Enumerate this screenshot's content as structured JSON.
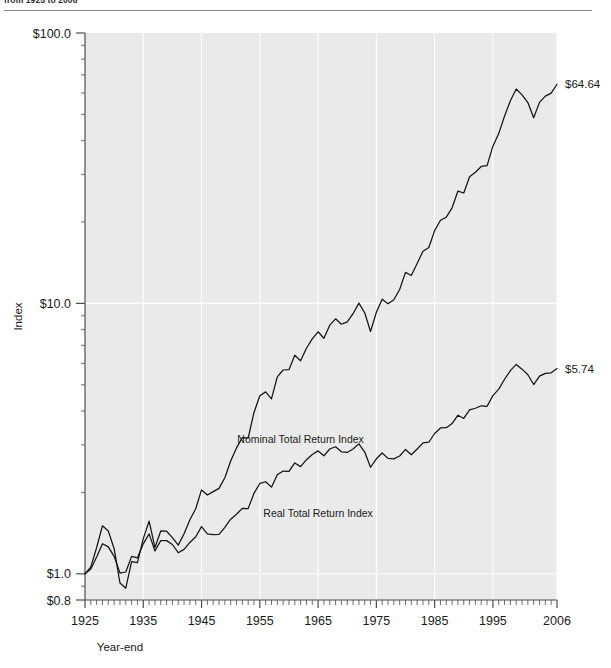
{
  "figure": {
    "title": "from 1925 to 2006",
    "title_visible": "partially cropped at top edge"
  },
  "chart_data": {
    "type": "line",
    "title": "from 1925 to 2006",
    "xlabel": "Year-end",
    "ylabel": "Index",
    "yscale": "log",
    "ylim": [
      0.8,
      100.0
    ],
    "xlim": [
      1925,
      2006
    ],
    "grid": "vertical white gridlines at each decade",
    "legend": "inline labels on plot",
    "y_ticks": [
      {
        "value": 100.0,
        "label": "$100.0"
      },
      {
        "value": 10.0,
        "label": "$10.0"
      },
      {
        "value": 1.0,
        "label": "$1.0"
      },
      {
        "value": 0.8,
        "label": "$0.8"
      }
    ],
    "x_ticks": [
      {
        "value": 1925,
        "label": "1925"
      },
      {
        "value": 1935,
        "label": "1935"
      },
      {
        "value": 1945,
        "label": "1945"
      },
      {
        "value": 1955,
        "label": "1955"
      },
      {
        "value": 1965,
        "label": "1965"
      },
      {
        "value": 1975,
        "label": "1975"
      },
      {
        "value": 1985,
        "label": "1985"
      },
      {
        "value": 1995,
        "label": "1995"
      },
      {
        "value": 2006,
        "label": "2006"
      }
    ],
    "x_minor_tick_interval": 1,
    "annotations": [
      {
        "name": "nominal-end-value",
        "text": "$64.64",
        "x": 2006,
        "y": 64.64
      },
      {
        "name": "real-end-value",
        "text": "$5.74",
        "x": 2006,
        "y": 5.74
      }
    ],
    "series": [
      {
        "name": "Nominal Total Return Index",
        "label": "Nominal Total Return Index",
        "label_x": 1962,
        "label_y": 3.05,
        "color": "#141414",
        "x": [
          1925,
          1926,
          1927,
          1928,
          1929,
          1930,
          1931,
          1932,
          1933,
          1934,
          1935,
          1936,
          1937,
          1938,
          1939,
          1940,
          1941,
          1942,
          1943,
          1944,
          1945,
          1946,
          1947,
          1948,
          1949,
          1950,
          1951,
          1952,
          1953,
          1954,
          1955,
          1956,
          1957,
          1958,
          1959,
          1960,
          1961,
          1962,
          1963,
          1964,
          1965,
          1966,
          1967,
          1968,
          1969,
          1970,
          1971,
          1972,
          1973,
          1974,
          1975,
          1976,
          1977,
          1978,
          1979,
          1980,
          1981,
          1982,
          1983,
          1984,
          1985,
          1986,
          1987,
          1988,
          1989,
          1990,
          1991,
          1992,
          1993,
          1994,
          1995,
          1996,
          1997,
          1998,
          1999,
          2000,
          2001,
          2002,
          2003,
          2004,
          2005,
          2006
        ],
        "values": [
          1.0,
          1.12,
          1.54,
          2.2,
          2.02,
          1.51,
          0.86,
          0.79,
          1.22,
          1.2,
          1.78,
          2.37,
          1.54,
          2.02,
          2.01,
          1.81,
          1.6,
          1.93,
          2.43,
          2.91,
          3.96,
          3.64,
          3.85,
          4.06,
          4.83,
          6.36,
          7.89,
          9.34,
          9.25,
          14.11,
          18.56,
          19.78,
          17.65,
          25.3,
          28.32,
          28.45,
          36.09,
          32.95,
          40.47,
          47.15,
          53.02,
          47.67,
          59.06,
          65.58,
          60.02,
          62.39,
          71.32,
          84.86,
          72.41,
          53.24,
          73.06,
          90.54,
          84.08,
          89.59,
          106.09,
          140.51,
          133.61,
          162.38,
          199.0,
          211.52,
          278.6,
          330.2,
          347.52,
          405.14,
          533.41,
          516.78,
          674.16,
          725.53,
          798.61,
          809.19,
          1113.92,
          1369.77,
          1827.05,
          2350.48,
          2845.63,
          2586.52,
          2279.19,
          1775.34,
          2284.81,
          2533.23,
          2657.29,
          3077.3
        ],
        "note": "values shown in chart are normalized to $1.00 at 1925 year-end and scaled; rendered path is the visual geometry"
      },
      {
        "name": "Real Total Return Index",
        "label": "Real Total Return Index",
        "label_x": 1965,
        "label_y": 1.62,
        "color": "#141414",
        "x": [
          1925,
          1926,
          1927,
          1928,
          1929,
          1930,
          1931,
          1932,
          1933,
          1934,
          1935,
          1936,
          1937,
          1938,
          1939,
          1940,
          1941,
          1942,
          1943,
          1944,
          1945,
          1946,
          1947,
          1948,
          1949,
          1950,
          1951,
          1952,
          1953,
          1954,
          1955,
          1956,
          1957,
          1958,
          1959,
          1960,
          1961,
          1962,
          1963,
          1964,
          1965,
          1966,
          1967,
          1968,
          1969,
          1970,
          1971,
          1972,
          1973,
          1974,
          1975,
          1976,
          1977,
          1978,
          1979,
          1980,
          1981,
          1982,
          1983,
          1984,
          1985,
          1986,
          1987,
          1988,
          1989,
          1990,
          1991,
          1992,
          1993,
          1994,
          1995,
          1996,
          1997,
          1998,
          1999,
          2000,
          2001,
          2002,
          2003,
          2004,
          2005,
          2006
        ],
        "values": [
          1.0,
          1.14,
          1.58,
          2.28,
          2.09,
          1.61,
          1.02,
          1.05,
          1.61,
          1.55,
          2.27,
          2.98,
          1.87,
          2.48,
          2.48,
          2.23,
          1.78,
          1.95,
          2.36,
          2.76,
          3.64,
          2.98,
          2.93,
          2.94,
          3.56,
          4.46,
          5.11,
          5.99,
          5.95,
          9.05,
          11.86,
          12.43,
          10.72,
          15.06,
          16.67,
          16.48,
          20.81,
          18.81,
          22.75,
          26.15,
          28.92,
          25.29,
          30.46,
          32.4,
          28.21,
          27.73,
          30.42,
          35.05,
          28.02,
          18.49,
          23.31,
          27.32,
          23.57,
          23.26,
          25.13,
          30.09,
          26.0,
          30.45,
          36.02,
          36.66,
          46.6,
          54.19,
          54.67,
          61.12,
          76.92,
          70.31,
          89.03,
          93.02,
          99.46,
          98.16,
          131.27,
          156.81,
          205.68,
          260.49,
          308.53,
          271.23,
          232.5,
          177.97,
          224.03,
          241.73,
          245.22,
          275.36
        ],
        "note": "inflation-adjusted; ends at $5.74 on the displayed normalized scale"
      }
    ]
  },
  "layout": {
    "plot_left": 85,
    "plot_right": 557,
    "plot_top": 33,
    "plot_bottom": 600
  }
}
